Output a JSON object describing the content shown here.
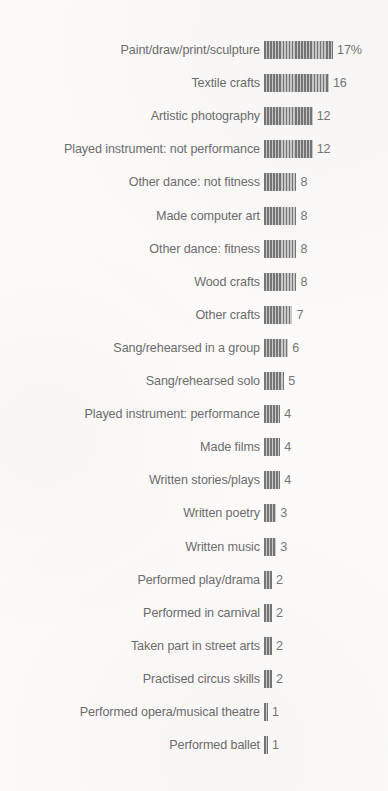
{
  "chart_data": {
    "type": "bar",
    "orientation": "horizontal",
    "title": "",
    "subtitle": "",
    "xlabel": "",
    "ylabel": "",
    "unit": "%",
    "grid": false,
    "legend": null,
    "axis_visible": false,
    "xlim": [
      0,
      17
    ],
    "categories": [
      "Paint/draw/print/sculpture",
      "Textile crafts",
      "Artistic photography",
      "Played instrument: not performance",
      "Other dance: not fitness",
      "Made computer art",
      "Other dance: fitness",
      "Wood crafts",
      "Other crafts",
      "Sang/rehearsed in a group",
      "Sang/rehearsed solo",
      "Played instrument: performance",
      "Made films",
      "Written stories/plays",
      "Written poetry",
      "Written music",
      "Performed play/drama",
      "Performed in carnival",
      "Taken part in street arts",
      "Practised circus skills",
      "Performed opera/musical theatre",
      "Performed ballet"
    ],
    "values": [
      17,
      16,
      12,
      12,
      8,
      8,
      8,
      8,
      7,
      6,
      5,
      4,
      4,
      4,
      3,
      3,
      2,
      2,
      2,
      2,
      1,
      1
    ],
    "value_labels": [
      "17%",
      "16",
      "12",
      "12",
      "8",
      "8",
      "8",
      "8",
      "7",
      "6",
      "5",
      "4",
      "4",
      "4",
      "3",
      "3",
      "2",
      "2",
      "2",
      "2",
      "1",
      "1"
    ],
    "colors": {
      "bar_dark_stripe": "#767676",
      "bar_light_stripe": "#cacaca",
      "label_text": "#6d6d6d",
      "value_text": "#777777",
      "background": "#fcfbfa"
    }
  }
}
